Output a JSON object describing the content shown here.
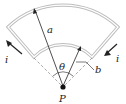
{
  "diagram": {
    "labels": {
      "outer_radius": "a",
      "inner_radius": "b",
      "angle": "θ",
      "point": "P",
      "current_left": "i",
      "current_right": "i"
    },
    "colors": {
      "wire": "#b8b8b8",
      "ink": "#222222",
      "dashed": "#888888"
    }
  }
}
